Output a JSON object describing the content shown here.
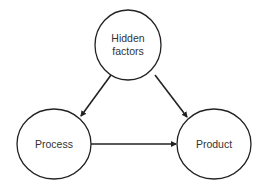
{
  "diagram": {
    "type": "causal-diagram",
    "colors": {
      "stroke": "#222222",
      "text": "#333333",
      "background": "#ffffff"
    },
    "nodes": [
      {
        "id": "hidden",
        "label_lines": [
          "Hidden",
          "factors"
        ],
        "cx": 128,
        "cy": 45,
        "rx": 33,
        "ry": 35
      },
      {
        "id": "process",
        "label_lines": [
          "Process"
        ],
        "cx": 54,
        "cy": 144,
        "rx": 37,
        "ry": 35
      },
      {
        "id": "product",
        "label_lines": [
          "Product"
        ],
        "cx": 214,
        "cy": 144,
        "rx": 37,
        "ry": 35
      }
    ],
    "edges": [
      {
        "from": "hidden",
        "to": "process"
      },
      {
        "from": "hidden",
        "to": "product"
      },
      {
        "from": "process",
        "to": "product"
      }
    ]
  }
}
